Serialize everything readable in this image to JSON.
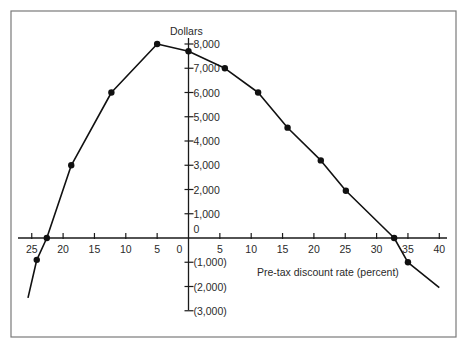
{
  "chart_data": {
    "type": "line",
    "title": "",
    "xlabel": "Pre-tax discount rate (percent)",
    "ylabel": "Dollars",
    "x_tick_labels_left": [
      "25",
      "20",
      "15",
      "10",
      "5",
      "0"
    ],
    "x_tick_values_left": [
      -25,
      -20,
      -15,
      -10,
      -5,
      0
    ],
    "x_tick_labels_right": [
      "5",
      "10",
      "15",
      "20",
      "25",
      "30",
      "35",
      "40"
    ],
    "x_tick_values_right": [
      5,
      10,
      15,
      20,
      25,
      30,
      35,
      40
    ],
    "y_ticks": [
      {
        "value": 8000,
        "label": "8,000"
      },
      {
        "value": 7000,
        "label": "7,000"
      },
      {
        "value": 6000,
        "label": "6,000"
      },
      {
        "value": 5000,
        "label": "5,000"
      },
      {
        "value": 4000,
        "label": "4,000"
      },
      {
        "value": 3000,
        "label": "3,000"
      },
      {
        "value": 2000,
        "label": "2,000"
      },
      {
        "value": 1000,
        "label": "1,000"
      },
      {
        "value": 0,
        "label": "0"
      },
      {
        "value": -1000,
        "label": "(1,000)"
      },
      {
        "value": -2000,
        "label": "(2,000)"
      },
      {
        "value": -3000,
        "label": "(3,000)"
      }
    ],
    "xlim": [
      -27,
      42
    ],
    "ylim": [
      -3300,
      8300
    ],
    "grid": false,
    "legend": null,
    "note": "Left side of x-axis shows negative discount rates labeled by magnitude",
    "series": [
      {
        "name": "Net present value",
        "line_start": {
          "x": -25.6,
          "y": -2470
        },
        "line_end": {
          "x": 40,
          "y": -2050
        },
        "points": [
          {
            "x": -24.2,
            "y": -900
          },
          {
            "x": -22.6,
            "y": 0
          },
          {
            "x": -18.7,
            "y": 3000
          },
          {
            "x": -12.3,
            "y": 6000
          },
          {
            "x": -5,
            "y": 8000
          },
          {
            "x": 0,
            "y": 7700
          },
          {
            "x": 5.8,
            "y": 7000
          },
          {
            "x": 11.1,
            "y": 6000
          },
          {
            "x": 15.8,
            "y": 4550
          },
          {
            "x": 21.1,
            "y": 3200
          },
          {
            "x": 25.1,
            "y": 1950
          },
          {
            "x": 32.8,
            "y": 0
          },
          {
            "x": 35,
            "y": -1000
          }
        ]
      }
    ]
  }
}
